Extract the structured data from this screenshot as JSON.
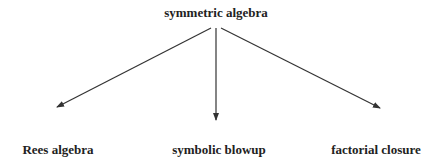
{
  "diagram": {
    "root": {
      "label": "symmetric algebra",
      "x": 216,
      "y": 6
    },
    "children": [
      {
        "label": "Rees algebra",
        "x": 58,
        "y": 143
      },
      {
        "label": "symbolic blowup",
        "x": 219,
        "y": 143
      },
      {
        "label": "factorial closure",
        "x": 376,
        "y": 143
      }
    ],
    "edges": [
      {
        "from": "symmetric algebra",
        "to": "Rees algebra",
        "x1": 211,
        "y1": 28,
        "x2": 57,
        "y2": 107
      },
      {
        "from": "symmetric algebra",
        "to": "symbolic blowup",
        "x1": 216,
        "y1": 28,
        "x2": 216,
        "y2": 120
      },
      {
        "from": "symmetric algebra",
        "to": "factorial closure",
        "x1": 221,
        "y1": 28,
        "x2": 380,
        "y2": 108
      }
    ],
    "colors": {
      "line": "#333333",
      "text": "#222222",
      "background": "#ffffff"
    }
  }
}
